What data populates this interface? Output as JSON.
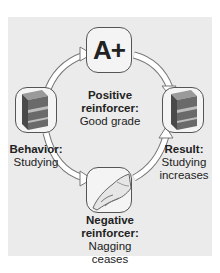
{
  "diagram": {
    "colors": {
      "panel_background": "#ebebeb",
      "tile_border": "#555555",
      "arrow_fill": "#ffffff",
      "arrow_stroke": "#777777",
      "book_color": "#6a6a6a",
      "text_color": "#222222"
    },
    "nodes": {
      "positive": {
        "icon": "grade-a-plus-icon",
        "icon_text": "A+",
        "heading_line1": "Positive",
        "heading_line2": "reinforcer:",
        "detail": "Good grade"
      },
      "behavior": {
        "icon": "book-icon",
        "heading": "Behavior:",
        "detail": "Studying"
      },
      "result": {
        "icon": "book-icon",
        "heading": "Result:",
        "detail_line1": "Studying",
        "detail_line2": "increases"
      },
      "negative": {
        "icon": "pointing-hand-icon",
        "heading_line1": "Negative",
        "heading_line2": "reinforcer:",
        "detail_line1": "Nagging",
        "detail_line2": "ceases"
      }
    },
    "edges": [
      {
        "from": "behavior",
        "to": "positive"
      },
      {
        "from": "positive",
        "to": "result"
      },
      {
        "from": "behavior",
        "to": "negative"
      },
      {
        "from": "negative",
        "to": "result"
      }
    ]
  }
}
